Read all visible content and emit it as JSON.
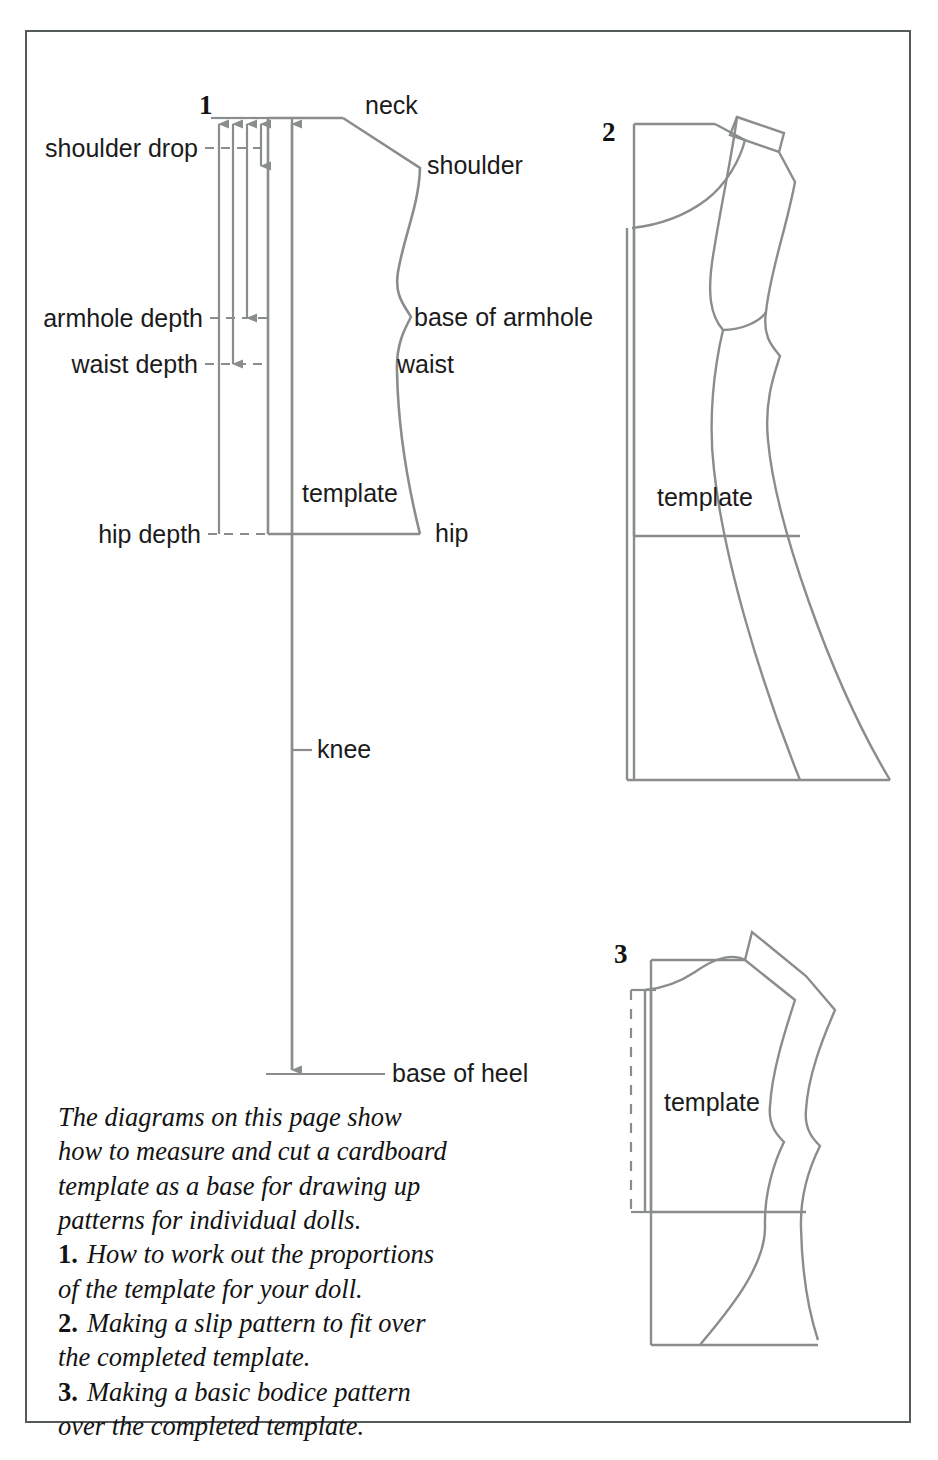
{
  "page": {
    "border_color": "#555a5c",
    "line_color": "#8a8d8e",
    "text_color": "#1b1b1b",
    "background": "#ffffff"
  },
  "figures": [
    {
      "id": "fig-1",
      "number": "1",
      "label": "How to work out the proportions of the template for your doll."
    },
    {
      "id": "fig-2",
      "number": "2",
      "label": "Making a slip pattern to fit over the completed template."
    },
    {
      "id": "fig-3",
      "number": "3",
      "label": "Making a basic bodice pattern over the completed template."
    }
  ],
  "diagram1": {
    "figure_number": "1",
    "measurement_labels": [
      {
        "name": "shoulder-drop",
        "text": "shoulder drop"
      },
      {
        "name": "armhole-depth",
        "text": "armhole depth"
      },
      {
        "name": "waist-depth",
        "text": "waist depth"
      },
      {
        "name": "hip-depth",
        "text": "hip depth"
      }
    ],
    "anatomy_labels": [
      {
        "name": "neck",
        "text": "neck"
      },
      {
        "name": "shoulder",
        "text": "shoulder"
      },
      {
        "name": "base-of-armhole",
        "text": "base of armhole"
      },
      {
        "name": "waist",
        "text": "waist"
      },
      {
        "name": "hip",
        "text": "hip"
      },
      {
        "name": "knee",
        "text": "knee"
      },
      {
        "name": "base-of-heel",
        "text": "base of heel"
      }
    ],
    "template_label": "template"
  },
  "diagram2": {
    "figure_number": "2",
    "template_label": "template"
  },
  "diagram3": {
    "figure_number": "3",
    "template_label": "template"
  },
  "caption": {
    "intro_line1": "The diagrams on this page show",
    "intro_line2": "how to measure and cut a cardboard",
    "intro_line3": "template as a base for drawing up",
    "intro_line4": "patterns for individual dolls.",
    "item1_num": "1.",
    "item1_line1": "How to work out the proportions",
    "item1_line2": "of the template for your doll.",
    "item2_num": "2.",
    "item2_line1": "Making a slip pattern to fit over",
    "item2_line2": "the completed template.",
    "item3_num": "3.",
    "item3_line1": "Making a basic bodice pattern",
    "item3_line2": "over the completed template."
  }
}
